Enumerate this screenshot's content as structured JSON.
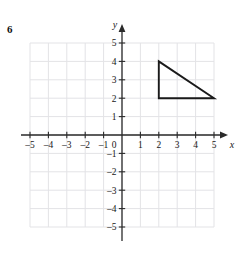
{
  "problem": {
    "number": "6"
  },
  "chart_data": {
    "type": "scatter",
    "title": "",
    "xlabel": "x",
    "ylabel": "y",
    "xlim": [
      -5.5,
      5.5
    ],
    "ylim": [
      -5.5,
      5.5
    ],
    "grid": true,
    "legend": null,
    "x_ticks": [
      -5,
      -4,
      -3,
      -2,
      -1,
      1,
      2,
      3,
      4,
      5
    ],
    "y_ticks": [
      5,
      4,
      3,
      2,
      1,
      -1,
      -2,
      -3,
      -4,
      -5
    ],
    "x_tick_labels": [
      "–5",
      "–4",
      "–3",
      "–2",
      "–1",
      "1",
      "2",
      "3",
      "4",
      "5"
    ],
    "y_tick_labels": [
      "5",
      "4",
      "3",
      "2",
      "1",
      "–1",
      "–2",
      "–3",
      "–4",
      "–5"
    ],
    "origin_label": "0",
    "shapes": [
      {
        "name": "triangle",
        "type": "polygon",
        "vertices": [
          [
            2,
            4
          ],
          [
            2,
            2
          ],
          [
            5,
            2
          ]
        ],
        "stroke": "#1a1a1a",
        "fill": "none"
      }
    ],
    "annotations": []
  },
  "colors": {
    "grid": "#e3e3e6",
    "axis": "#2a2a2a",
    "shape_stroke": "#1a1a1a",
    "text": "#171717",
    "background": "#ffffff"
  }
}
